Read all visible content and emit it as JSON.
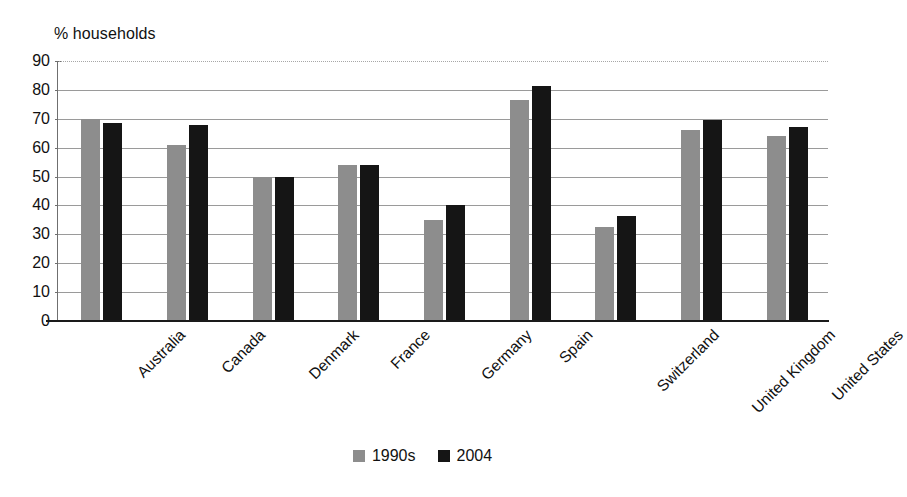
{
  "chart_data": {
    "type": "bar",
    "title": "",
    "ylabel": "% households",
    "xlabel": "",
    "ylim": [
      0,
      90
    ],
    "yticks": [
      0,
      10,
      20,
      30,
      40,
      50,
      60,
      70,
      80,
      90
    ],
    "grid": true,
    "legend_position": "bottom-center",
    "categories": [
      "Australia",
      "Canada",
      "Denmark",
      "France",
      "Germany",
      "Spain",
      "Switzerland",
      "United Kingdom",
      "United States"
    ],
    "series": [
      {
        "name": "1990s",
        "color": "#8d8d8d",
        "values": [
          70,
          61,
          50,
          54,
          35,
          76.5,
          32.5,
          66,
          64
        ]
      },
      {
        "name": "2004",
        "color": "#151515",
        "values": [
          68.5,
          68,
          50,
          54,
          40,
          81.5,
          36.5,
          69.5,
          67
        ]
      }
    ]
  },
  "legend": {
    "entries": [
      {
        "label": "1990s",
        "color": "#8d8d8d"
      },
      {
        "label": "2004",
        "color": "#151515"
      }
    ]
  },
  "colors": {
    "series_1990s": "#8d8d8d",
    "series_2004": "#151515",
    "gridline": "#9a9a9a",
    "axis": "#1a1a1a",
    "background": "#ffffff",
    "text": "#111111"
  }
}
